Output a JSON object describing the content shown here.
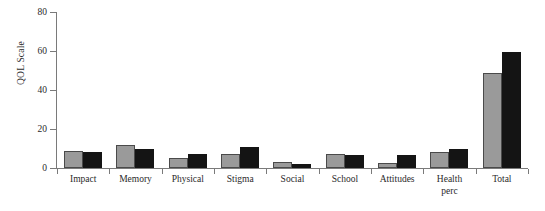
{
  "chart_data": {
    "type": "bar",
    "title": "",
    "xlabel": "",
    "ylabel": "QOL Scale",
    "ylim": [
      0,
      80
    ],
    "yticks": [
      0,
      20,
      40,
      60,
      80
    ],
    "ytick_labels": [
      "0",
      "20",
      "40",
      "60",
      "80"
    ],
    "grid": false,
    "legend": "none",
    "categories": [
      "Impact",
      "Memory",
      "Physical",
      "Stigma",
      "Social",
      "School",
      "Attitudes",
      "Health\nperc",
      "Total"
    ],
    "series": [
      {
        "name": "series-1",
        "color": "#9a9a9a",
        "values": [
          8.5,
          12,
          5,
          7,
          3,
          7,
          2.5,
          8,
          48.5
        ]
      },
      {
        "name": "series-2",
        "color": "#141414",
        "values": [
          8,
          10,
          7,
          11,
          2,
          6.5,
          6.5,
          10,
          59.5
        ]
      }
    ]
  },
  "colors": {
    "series_gray": "#9a9a9a",
    "series_black": "#141414",
    "axis": "#7a7a7a",
    "text": "#2a2a2a",
    "background": "#ffffff"
  }
}
